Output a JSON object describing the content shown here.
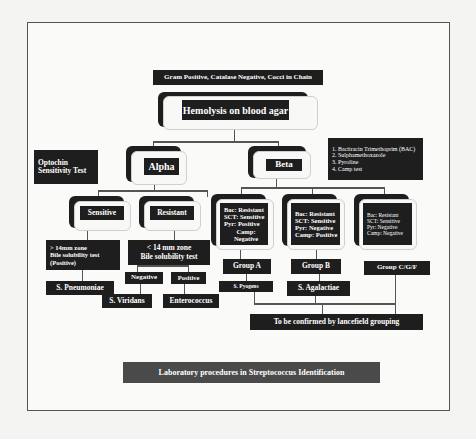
{
  "diagram": {
    "root_label": "Gram Positive, Catalase Negative, Cocci in Chain",
    "hemolysis": "Hemolysis on blood agar",
    "optochin": [
      "Optochin",
      "Sensitivity Test"
    ],
    "tests_list": [
      "1. Bacitracin Trimethoprim (BAC)",
      "2. Sulphamethoxazole",
      "3. Pyroline",
      "4. Camp test"
    ],
    "alpha": "Alpha",
    "beta": "Beta",
    "sensitive": "Sensitive",
    "resistant": "Resistant",
    "sensitive_result": [
      "> 14mm zone",
      "Bile solubility test",
      "(Positive)"
    ],
    "resistant_result": [
      "< 14 mm zone",
      "Bile solubility test"
    ],
    "negative": "Negative",
    "positive": "Positive",
    "s_pneumoniae": "S. Pneumoniae",
    "s_viridans": "S. Viridans",
    "enterococcus": "Enterococcus",
    "beta_groups": [
      {
        "tests": [
          "Bac: Resistant",
          "SCT: Sensitive",
          "Pyr: Positive",
          "Camp: Negative"
        ],
        "group": "Group A",
        "species": "S. Pyogens"
      },
      {
        "tests": [
          "Bac: Resistant",
          "SCT: Sensitive",
          "Pyr: Negative",
          "Camp: Positive"
        ],
        "group": "Group B",
        "species": "S. Agalactiae"
      },
      {
        "tests": [
          "Bac: Resistant",
          "SCT: Sensitive",
          "Pyr: Negative",
          "Camp: Negative"
        ],
        "group": "Group C/G/F",
        "species": ""
      }
    ],
    "confirm": "To be confirmed by lancefield grouping",
    "caption": "Laboratory procedures in Streptococcus Identification"
  }
}
